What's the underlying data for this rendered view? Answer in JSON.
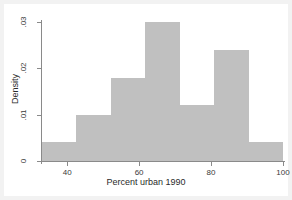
{
  "chart_data": {
    "type": "bar",
    "title": "",
    "subtitle": "",
    "xlabel": "Percent urban 1990",
    "ylabel": "Density",
    "xlim": [
      33,
      100
    ],
    "ylim": [
      0,
      0.03
    ],
    "grid": false,
    "legend": null,
    "bin_width": 9.57,
    "bin_edges": [
      33,
      42.57,
      52.14,
      61.71,
      71.29,
      80.86,
      90.43,
      100
    ],
    "categories": [
      "33-42.6",
      "42.6-52.1",
      "52.1-61.7",
      "61.7-71.3",
      "71.3-80.9",
      "80.9-90.4",
      "90.4-100"
    ],
    "values": [
      0.004,
      0.01,
      0.018,
      0.03,
      0.012,
      0.024,
      0.004
    ],
    "bar_color": "#c0c0c0",
    "xticks": [
      {
        "value": 40,
        "label": "40"
      },
      {
        "value": 60,
        "label": "60"
      },
      {
        "value": 80,
        "label": "80"
      },
      {
        "value": 100,
        "label": "100"
      }
    ],
    "yticks": [
      {
        "value": 0,
        "label": "0"
      },
      {
        "value": 0.01,
        "label": ".01"
      },
      {
        "value": 0.02,
        "label": ".02"
      },
      {
        "value": 0.03,
        "label": ".03"
      }
    ]
  },
  "figure": {
    "background_color": "#f2f2f2",
    "plot_background_color": "#ffffff",
    "axis_color": "#8a8a8a"
  }
}
